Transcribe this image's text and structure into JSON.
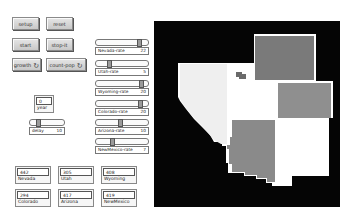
{
  "buttons": {
    "setup": "setup",
    "reset": "reset",
    "start": "start",
    "stop": "stop-it",
    "growth": "growth",
    "count_pop": "count-pop",
    "loop_glyph": "↻"
  },
  "sliders": [
    {
      "label": "Nevada-rate",
      "value": "22",
      "pos": 0.85
    },
    {
      "label": "Utah-rate",
      "value": "5",
      "pos": 0.22
    },
    {
      "label": "Wyoming-rate",
      "value": "20",
      "pos": 0.9
    },
    {
      "label": "Colorado-rate",
      "value": "20",
      "pos": 0.88
    },
    {
      "label": "Arizona-rate",
      "value": "10",
      "pos": 0.45
    },
    {
      "label": "NewMexico-rate",
      "value": "7",
      "pos": 0.3
    }
  ],
  "year_monitor": {
    "label": "year",
    "value": "0"
  },
  "delay_slider": {
    "label": "delay",
    "value": "10",
    "pos": 0.2
  },
  "state_monitors": [
    {
      "name": "Nevada",
      "value": "442"
    },
    {
      "name": "Utah",
      "value": "305"
    },
    {
      "name": "Wyoming",
      "value": "408"
    },
    {
      "name": "Colorado",
      "value": "294"
    },
    {
      "name": "Arizona",
      "value": "417"
    },
    {
      "name": "NewMexico",
      "value": "419"
    }
  ],
  "world": {
    "background": "#050505",
    "colors": {
      "nevada": "#efefef",
      "utah": "#ffffff",
      "wyoming": "#7a7a7a",
      "colorado": "#8f8f8f",
      "arizona": "#8a8a8a",
      "newmexico": "#ffffff",
      "border": "#ffffff",
      "lake": "#6a6a6a"
    }
  }
}
